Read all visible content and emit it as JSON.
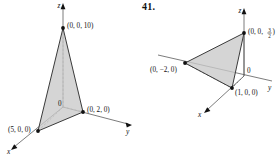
{
  "sheet": {
    "exercise_number": "41."
  },
  "figures": [
    {
      "id": "left-figure",
      "name": "plane-through-intercepts-5-2-10",
      "axes": [
        {
          "name": "z-axis",
          "label": "z"
        },
        {
          "name": "y-axis",
          "label": "y"
        },
        {
          "name": "x-axis",
          "label": "x"
        }
      ],
      "origin_label": "0",
      "vertices": [
        {
          "name": "z-intercept",
          "label": "(0, 0, 10)"
        },
        {
          "name": "y-intercept",
          "label": "(0, 2, 0)"
        },
        {
          "name": "x-intercept",
          "label": "(5, 0, 0)"
        }
      ]
    },
    {
      "id": "right-figure",
      "name": "plane-through-intercepts-1-neg2-three-halves",
      "axes": [
        {
          "name": "z-axis",
          "label": "z"
        },
        {
          "name": "y-axis",
          "label": "y"
        },
        {
          "name": "x-axis",
          "label": "x"
        }
      ],
      "origin_label": "0",
      "vertices": [
        {
          "name": "z-intercept",
          "label": "(0, 0, ",
          "frac_numerator": "3",
          "frac_denominator": "2",
          "label_close": ")"
        },
        {
          "name": "y-intercept",
          "label": "(0, −2, 0)"
        },
        {
          "name": "x-intercept",
          "label": "(1, 0, 0)"
        }
      ]
    }
  ],
  "colors": {
    "face_fill": "#c9c9c9",
    "edge_stroke": "#3a3a3a",
    "axis_stroke": "#5a5a5a",
    "text": "#111111",
    "background": "#ffffff"
  }
}
